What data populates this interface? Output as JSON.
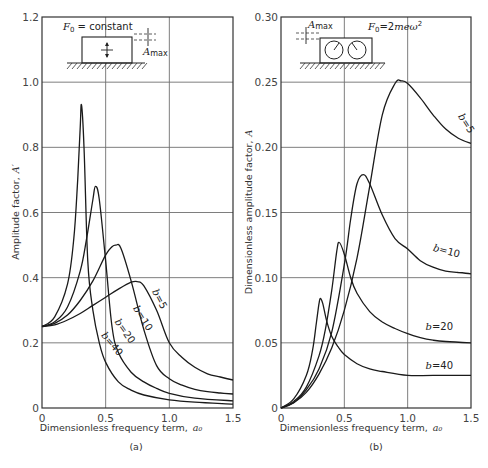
{
  "figure": {
    "panel_a": {
      "caption": "(a)",
      "xlabel": "Dimensionless frequency term,",
      "xlabel_symbol": "a₀",
      "ylabel": "Amplitude factor,",
      "ylabel_symbol": "A′",
      "inset_force": "F₀ = constant",
      "inset_amax": "A",
      "inset_amax_sub": "max"
    },
    "panel_b": {
      "caption": "(b)",
      "xlabel": "Dimensionless frequency term,",
      "xlabel_symbol": "a₀",
      "ylabel": "Dimensionless amplitude factor,",
      "ylabel_symbol": "A",
      "inset_force": "F₀ = 2meω²",
      "inset_amax": "A",
      "inset_amax_sub": "max"
    }
  },
  "chart_data": [
    {
      "type": "line",
      "title": "(a)",
      "xlabel": "Dimensionless frequency term, a0",
      "ylabel": "Amplitude factor, A'",
      "xlim": [
        0,
        1.5
      ],
      "ylim": [
        0,
        1.2
      ],
      "xticks": [
        0,
        0.5,
        1.0,
        1.5
      ],
      "xtick_labels": [
        "0",
        "0.5",
        "1.0",
        "1.5"
      ],
      "yticks": [
        0,
        0.2,
        0.4,
        0.6,
        0.8,
        1.0,
        1.2
      ],
      "ytick_labels": [
        "0",
        "0.2",
        "0.4",
        "0.6",
        "0.8",
        "1.0",
        "1.2"
      ],
      "grid": true,
      "annotation": "F0 = constant",
      "series": [
        {
          "name": "b = 5",
          "label": "b = 5",
          "x": [
            0,
            0.1,
            0.2,
            0.3,
            0.4,
            0.5,
            0.6,
            0.7,
            0.75,
            0.8,
            0.9,
            1.0,
            1.1,
            1.2,
            1.3,
            1.4,
            1.5
          ],
          "y": [
            0.25,
            0.255,
            0.27,
            0.29,
            0.315,
            0.34,
            0.365,
            0.386,
            0.388,
            0.375,
            0.3,
            0.2,
            0.155,
            0.125,
            0.105,
            0.095,
            0.086
          ]
        },
        {
          "name": "b = 10",
          "label": "b = 10",
          "x": [
            0,
            0.1,
            0.2,
            0.3,
            0.4,
            0.5,
            0.55,
            0.58,
            0.62,
            0.7,
            0.8,
            0.9,
            1.0,
            1.1,
            1.2,
            1.3,
            1.4,
            1.5
          ],
          "y": [
            0.25,
            0.26,
            0.285,
            0.33,
            0.39,
            0.47,
            0.495,
            0.5,
            0.49,
            0.39,
            0.24,
            0.13,
            0.09,
            0.07,
            0.057,
            0.05,
            0.046,
            0.043
          ]
        },
        {
          "name": "b = 20",
          "label": "b = 20",
          "x": [
            0,
            0.1,
            0.2,
            0.3,
            0.35,
            0.4,
            0.42,
            0.45,
            0.5,
            0.55,
            0.6,
            0.7,
            0.8,
            0.9,
            1.0,
            1.2,
            1.5
          ],
          "y": [
            0.25,
            0.265,
            0.31,
            0.42,
            0.52,
            0.64,
            0.68,
            0.64,
            0.45,
            0.25,
            0.17,
            0.11,
            0.08,
            0.06,
            0.045,
            0.03,
            0.022
          ]
        },
        {
          "name": "b = 40",
          "label": "b = 40",
          "x": [
            0,
            0.1,
            0.2,
            0.25,
            0.28,
            0.3,
            0.31,
            0.33,
            0.36,
            0.4,
            0.45,
            0.5,
            0.6,
            0.7,
            0.8,
            1.0,
            1.2,
            1.5
          ],
          "y": [
            0.25,
            0.28,
            0.38,
            0.52,
            0.7,
            0.86,
            0.93,
            0.8,
            0.45,
            0.3,
            0.2,
            0.14,
            0.08,
            0.055,
            0.04,
            0.025,
            0.018,
            0.012
          ]
        }
      ]
    },
    {
      "type": "line",
      "title": "(b)",
      "xlabel": "Dimensionless frequency term, a0",
      "ylabel": "Dimensionless amplitude factor, A",
      "xlim": [
        0,
        1.5
      ],
      "ylim": [
        0,
        0.3
      ],
      "xticks": [
        0,
        0.5,
        1.0,
        1.5
      ],
      "xtick_labels": [
        "0",
        "0.5",
        "1.0",
        "1.5"
      ],
      "yticks": [
        0,
        0.05,
        0.1,
        0.15,
        0.2,
        0.25,
        0.3
      ],
      "ytick_labels": [
        "0",
        "0.05",
        "0.10",
        "0.15",
        "0.20",
        "0.25",
        "0.30"
      ],
      "grid": true,
      "annotation": "F0 = 2meω²",
      "series": [
        {
          "name": "b = 5",
          "label": "b = 5",
          "x": [
            0,
            0.1,
            0.2,
            0.3,
            0.4,
            0.5,
            0.6,
            0.7,
            0.8,
            0.9,
            0.95,
            1.0,
            1.1,
            1.2,
            1.3,
            1.4,
            1.5
          ],
          "y": [
            0,
            0.004,
            0.012,
            0.026,
            0.046,
            0.075,
            0.115,
            0.17,
            0.225,
            0.249,
            0.251,
            0.249,
            0.238,
            0.225,
            0.214,
            0.207,
            0.203
          ]
        },
        {
          "name": "b = 10",
          "label": "b = 10",
          "x": [
            0,
            0.1,
            0.2,
            0.3,
            0.4,
            0.5,
            0.55,
            0.6,
            0.65,
            0.7,
            0.8,
            0.9,
            1.0,
            1.1,
            1.2,
            1.3,
            1.4,
            1.5
          ],
          "y": [
            0,
            0.004,
            0.014,
            0.03,
            0.058,
            0.11,
            0.145,
            0.172,
            0.179,
            0.172,
            0.148,
            0.13,
            0.122,
            0.113,
            0.108,
            0.105,
            0.104,
            0.103
          ]
        },
        {
          "name": "b = 20",
          "label": "b = 20",
          "x": [
            0,
            0.1,
            0.2,
            0.3,
            0.35,
            0.4,
            0.44,
            0.46,
            0.5,
            0.55,
            0.6,
            0.7,
            0.8,
            0.9,
            1.0,
            1.1,
            1.2,
            1.3,
            1.5
          ],
          "y": [
            0,
            0.005,
            0.016,
            0.04,
            0.06,
            0.09,
            0.12,
            0.127,
            0.118,
            0.1,
            0.088,
            0.074,
            0.066,
            0.061,
            0.057,
            0.054,
            0.052,
            0.051,
            0.05
          ]
        },
        {
          "name": "b = 40",
          "label": "b = 40",
          "x": [
            0,
            0.1,
            0.2,
            0.25,
            0.28,
            0.3,
            0.31,
            0.33,
            0.36,
            0.4,
            0.45,
            0.5,
            0.6,
            0.7,
            0.8,
            1.0,
            1.2,
            1.5
          ],
          "y": [
            0,
            0.007,
            0.025,
            0.045,
            0.066,
            0.08,
            0.084,
            0.08,
            0.067,
            0.055,
            0.047,
            0.041,
            0.034,
            0.03,
            0.028,
            0.025,
            0.025,
            0.025
          ]
        }
      ]
    }
  ]
}
